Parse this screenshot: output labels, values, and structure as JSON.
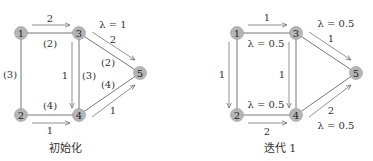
{
  "panels": [
    {
      "caption": "初始化",
      "nodes": [
        {
          "id": "1",
          "x": 21,
          "y": 33
        },
        {
          "id": "3",
          "x": 79,
          "y": 33
        },
        {
          "id": "2",
          "x": 21,
          "y": 115
        },
        {
          "id": "4",
          "x": 79,
          "y": 115
        },
        {
          "id": "5",
          "x": 140,
          "y": 73
        }
      ],
      "labels": {
        "e13_flow": "2",
        "e13_cap": "(2)",
        "e12_cap": "(3)",
        "e24_cap": "(4)",
        "e24_flow": "1",
        "e34_flow": "1",
        "e34_cap": "(3)",
        "e35_lambda": "λ = 1",
        "e35_flow": "2",
        "e35_cap": "(2)",
        "e45_cap": "(4)",
        "e45_flow": "1"
      }
    },
    {
      "caption": "迭代 1",
      "nodes": [
        {
          "id": "1",
          "x": 237,
          "y": 33
        },
        {
          "id": "3",
          "x": 296,
          "y": 33
        },
        {
          "id": "2",
          "x": 237,
          "y": 115
        },
        {
          "id": "4",
          "x": 296,
          "y": 115
        },
        {
          "id": "5",
          "x": 356,
          "y": 73
        }
      ],
      "labels": {
        "e13_flow": "1",
        "e13_lambda": "λ = 0.5",
        "e12_flow": "1",
        "e24_lambda": "λ = 0.5",
        "e24_flow": "2",
        "e34_flow": "1",
        "e35_lambda": "λ = 0.5",
        "e35_flow": "1",
        "e45_flow": "2",
        "e45_lambda": "λ = 0.5"
      }
    }
  ]
}
